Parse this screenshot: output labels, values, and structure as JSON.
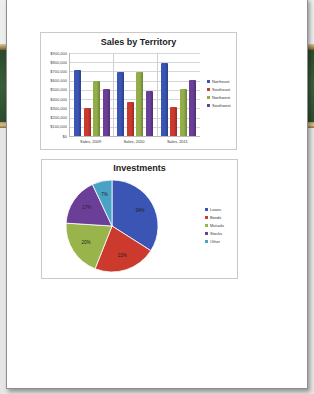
{
  "colors": {
    "northeast": "#3a55b4",
    "southeast": "#cc3a2e",
    "northwest": "#93ae48",
    "southwest": "#6b3f98",
    "loans": "#3a55b4",
    "bonds": "#cc3a2e",
    "mutuals": "#98b44a",
    "stocks": "#6b3f98",
    "other": "#4aa3c4"
  },
  "chart_data": [
    {
      "type": "bar",
      "title": "Sales by Territory",
      "xlabel": "",
      "ylabel": "",
      "categories": [
        "Sales, 2009",
        "Sales, 2010",
        "Sales, 2011"
      ],
      "series": [
        {
          "name": "Northeast",
          "values": [
            720000,
            690000,
            790000
          ]
        },
        {
          "name": "Southeast",
          "values": [
            300000,
            370000,
            320000
          ]
        },
        {
          "name": "Northwest",
          "values": [
            600000,
            690000,
            510000
          ]
        },
        {
          "name": "Southwest",
          "values": [
            510000,
            490000,
            610000
          ]
        }
      ],
      "yticks": [
        "$900,000",
        "$800,000",
        "$700,000",
        "$600,000",
        "$500,000",
        "$400,000",
        "$300,000",
        "$200,000",
        "$100,000",
        "$0"
      ],
      "ylim": [
        0,
        900000
      ],
      "grid": true,
      "legend_position": "right"
    },
    {
      "type": "pie",
      "title": "Investments",
      "categories": [
        "Loans",
        "Bonds",
        "Mutuals",
        "Stocks",
        "Other"
      ],
      "values": [
        34,
        22,
        20,
        17,
        7
      ],
      "labels": [
        "34%",
        "22%",
        "20%",
        "17%",
        "7%"
      ],
      "legend_position": "right"
    }
  ]
}
